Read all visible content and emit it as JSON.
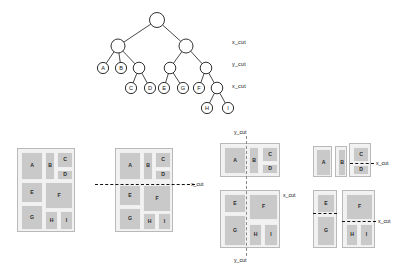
{
  "figure": {
    "kind": "slicing-floorplan-figure",
    "colors": {
      "block_fill": "#c9c9c9",
      "board_fill": "#f2f2f2",
      "board_border": "#b9b9b9",
      "cut_line": "#2b2b2b",
      "text": "#1a1a1a"
    }
  },
  "tree": {
    "levels": [
      {
        "label": "x_cut"
      },
      {
        "label": "y_cut"
      },
      {
        "label": "x_cut"
      }
    ],
    "level_label_0": "x_cut",
    "level_label_1": "y_cut",
    "level_label_2": "x_cut",
    "nodes": [
      {
        "id": "root",
        "label": "",
        "x": 157,
        "y": 20,
        "r": 7.5,
        "leaf": false
      },
      {
        "id": "n1",
        "label": "",
        "x": 118,
        "y": 46,
        "r": 7.0,
        "leaf": false
      },
      {
        "id": "n2",
        "label": "",
        "x": 186,
        "y": 46,
        "r": 7.0,
        "leaf": false
      },
      {
        "id": "A",
        "label": "A",
        "x": 103,
        "y": 68,
        "r": 5.6,
        "leaf": true
      },
      {
        "id": "B",
        "label": "B",
        "x": 121,
        "y": 68,
        "r": 5.6,
        "leaf": true
      },
      {
        "id": "n3",
        "label": "",
        "x": 139,
        "y": 68,
        "r": 5.8,
        "leaf": false
      },
      {
        "id": "n4",
        "label": "",
        "x": 170,
        "y": 68,
        "r": 5.8,
        "leaf": false
      },
      {
        "id": "n5",
        "label": "",
        "x": 206,
        "y": 68,
        "r": 5.8,
        "leaf": false
      },
      {
        "id": "C",
        "label": "C",
        "x": 131,
        "y": 88,
        "r": 5.6,
        "leaf": true
      },
      {
        "id": "D",
        "label": "D",
        "x": 150,
        "y": 88,
        "r": 5.6,
        "leaf": true
      },
      {
        "id": "E",
        "label": "E",
        "x": 164,
        "y": 88,
        "r": 5.6,
        "leaf": true
      },
      {
        "id": "G",
        "label": "G",
        "x": 183,
        "y": 88,
        "r": 5.6,
        "leaf": true
      },
      {
        "id": "F",
        "label": "F",
        "x": 199,
        "y": 88,
        "r": 5.6,
        "leaf": true
      },
      {
        "id": "n6",
        "label": "",
        "x": 217,
        "y": 88,
        "r": 5.8,
        "leaf": false
      },
      {
        "id": "H",
        "label": "H",
        "x": 207,
        "y": 108,
        "r": 5.6,
        "leaf": true
      },
      {
        "id": "I",
        "label": "I",
        "x": 228,
        "y": 108,
        "r": 5.6,
        "leaf": true
      }
    ],
    "edges": [
      [
        "root",
        "n1"
      ],
      [
        "root",
        "n2"
      ],
      [
        "n1",
        "A"
      ],
      [
        "n1",
        "B"
      ],
      [
        "n1",
        "n3"
      ],
      [
        "n2",
        "n4"
      ],
      [
        "n2",
        "n5"
      ],
      [
        "n3",
        "C"
      ],
      [
        "n3",
        "D"
      ],
      [
        "n4",
        "E"
      ],
      [
        "n4",
        "G"
      ],
      [
        "n5",
        "F"
      ],
      [
        "n5",
        "n6"
      ],
      [
        "n6",
        "H"
      ],
      [
        "n6",
        "I"
      ]
    ]
  },
  "floorplans": [
    {
      "id": "fp1",
      "name": "full-floorplan",
      "board": {
        "x": 17,
        "y": 148,
        "w": 58,
        "h": 84
      },
      "blocks": [
        {
          "label": "A",
          "x": 3,
          "y": 3,
          "w": 22,
          "h": 28
        },
        {
          "label": "B",
          "x": 27,
          "y": 3,
          "w": 10,
          "h": 28
        },
        {
          "label": "C",
          "x": 39,
          "y": 3,
          "w": 16,
          "h": 16
        },
        {
          "label": "D",
          "x": 39,
          "y": 21,
          "w": 16,
          "h": 10
        },
        {
          "label": "E",
          "x": 3,
          "y": 33,
          "w": 22,
          "h": 21
        },
        {
          "label": "F",
          "x": 27,
          "y": 33,
          "w": 28,
          "h": 27
        },
        {
          "label": "G",
          "x": 3,
          "y": 56,
          "w": 22,
          "h": 25
        },
        {
          "label": "H",
          "x": 27,
          "y": 62,
          "w": 13,
          "h": 19
        },
        {
          "label": "I",
          "x": 42,
          "y": 62,
          "w": 13,
          "h": 19
        }
      ],
      "cuts": [],
      "labels": []
    },
    {
      "id": "fp2",
      "name": "floorplan-first-x-cut",
      "board": {
        "x": 115,
        "y": 148,
        "w": 58,
        "h": 84
      },
      "blocks": [
        {
          "label": "A",
          "x": 3,
          "y": 3,
          "w": 22,
          "h": 28
        },
        {
          "label": "B",
          "x": 27,
          "y": 3,
          "w": 10,
          "h": 28
        },
        {
          "label": "C",
          "x": 39,
          "y": 3,
          "w": 16,
          "h": 16
        },
        {
          "label": "D",
          "x": 39,
          "y": 21,
          "w": 16,
          "h": 10
        },
        {
          "label": "E",
          "x": 3,
          "y": 36,
          "w": 22,
          "h": 21
        },
        {
          "label": "F",
          "x": 27,
          "y": 36,
          "w": 28,
          "h": 27
        },
        {
          "label": "G",
          "x": 3,
          "y": 59,
          "w": 22,
          "h": 22
        },
        {
          "label": "H",
          "x": 27,
          "y": 64,
          "w": 13,
          "h": 17
        },
        {
          "label": "I",
          "x": 42,
          "y": 64,
          "w": 13,
          "h": 17
        }
      ],
      "cuts": [
        {
          "dir": "h",
          "x": 95,
          "y": 184,
          "len": 100,
          "thick": true
        }
      ],
      "labels": [
        {
          "text": "x_cut",
          "x": 191,
          "y": 181
        }
      ]
    },
    {
      "id": "fp3",
      "name": "floorplan-split-halves-y-cut",
      "top": {
        "board": {
          "x": 220,
          "y": 143,
          "w": 60,
          "h": 34
        },
        "blocks": [
          {
            "label": "A",
            "x": 3,
            "y": 3,
            "w": 22,
            "h": 27
          },
          {
            "label": "B",
            "x": 28,
            "y": 3,
            "w": 10,
            "h": 27
          },
          {
            "label": "C",
            "x": 41,
            "y": 3,
            "w": 16,
            "h": 15
          },
          {
            "label": "D",
            "x": 41,
            "y": 20,
            "w": 16,
            "h": 10
          }
        ],
        "cut": {
          "dir": "v",
          "x": 246,
          "y": 136,
          "len": 48
        },
        "label": {
          "text": "y_cut",
          "x": 234,
          "y": 129
        }
      },
      "bottom": {
        "board": {
          "x": 220,
          "y": 190,
          "w": 60,
          "h": 58
        },
        "blocks": [
          {
            "label": "E",
            "x": 3,
            "y": 3,
            "w": 22,
            "h": 19
          },
          {
            "label": "F",
            "x": 28,
            "y": 3,
            "w": 29,
            "h": 26
          },
          {
            "label": "G",
            "x": 3,
            "y": 24,
            "w": 22,
            "h": 31
          },
          {
            "label": "H",
            "x": 28,
            "y": 33,
            "w": 13,
            "h": 22
          },
          {
            "label": "I",
            "x": 43,
            "y": 33,
            "w": 14,
            "h": 22
          }
        ],
        "cut": {
          "dir": "v",
          "x": 246,
          "y": 186,
          "len": 70
        },
        "label": {
          "text": "y_cut",
          "x": 234,
          "y": 257
        }
      },
      "side_label": {
        "text": "x_cut",
        "x": 283,
        "y": 192
      }
    },
    {
      "id": "fp4",
      "name": "floorplan-quadrants-x-cut",
      "groups": [
        {
          "name": "group-A",
          "board": {
            "x": 313,
            "y": 146,
            "w": 19,
            "h": 31
          },
          "blocks": [
            {
              "label": "A",
              "x": 2,
              "y": 2,
              "w": 15,
              "h": 27
            }
          ]
        },
        {
          "name": "group-B",
          "board": {
            "x": 335,
            "y": 146,
            "w": 12,
            "h": 31
          },
          "blocks": [
            {
              "label": "B",
              "x": 2,
              "y": 2,
              "w": 8,
              "h": 27
            }
          ]
        },
        {
          "name": "group-CD",
          "board": {
            "x": 349,
            "y": 143,
            "w": 22,
            "h": 34
          },
          "blocks": [
            {
              "label": "C",
              "x": 3,
              "y": 3,
              "w": 16,
              "h": 15
            },
            {
              "label": "D",
              "x": 3,
              "y": 21,
              "w": 16,
              "h": 10
            }
          ],
          "cut": {
            "dir": "h",
            "x": 350,
            "y": 163,
            "len": 24,
            "thick": true
          },
          "label": {
            "text": "x_cut",
            "x": 376,
            "y": 160
          }
        },
        {
          "name": "group-EG",
          "board": {
            "x": 313,
            "y": 190,
            "w": 24,
            "h": 58
          },
          "blocks": [
            {
              "label": "E",
              "x": 3,
              "y": 3,
              "w": 18,
              "h": 19
            },
            {
              "label": "G",
              "x": 3,
              "y": 25,
              "w": 18,
              "h": 30
            }
          ],
          "cut": {
            "dir": "h",
            "x": 313,
            "y": 213,
            "len": 24,
            "thick": true
          }
        },
        {
          "name": "group-FHI",
          "board": {
            "x": 342,
            "y": 190,
            "w": 33,
            "h": 58
          },
          "blocks": [
            {
              "label": "F",
              "x": 3,
              "y": 3,
              "w": 27,
              "h": 26
            },
            {
              "label": "H",
              "x": 3,
              "y": 33,
              "w": 12,
              "h": 22
            },
            {
              "label": "I",
              "x": 17,
              "y": 33,
              "w": 13,
              "h": 22
            }
          ],
          "cut": {
            "dir": "h",
            "x": 342,
            "y": 221,
            "len": 34,
            "thick": true
          },
          "label": {
            "text": "x_cut",
            "x": 378,
            "y": 218
          }
        }
      ]
    }
  ]
}
